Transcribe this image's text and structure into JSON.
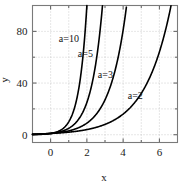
{
  "chart_data": {
    "type": "line",
    "title": "",
    "subtitle": "",
    "xlabel": "x",
    "ylabel": "y",
    "xlim": [
      -1,
      7
    ],
    "ylim": [
      -6,
      100
    ],
    "grid": true,
    "legend_position": "inline-annotations",
    "function": "y = a^x",
    "x_ticks": [
      0,
      2,
      4,
      6
    ],
    "x_tick_labels": [
      "0",
      "2",
      "4",
      "6"
    ],
    "x_minor_ticks": [
      -1,
      1,
      3,
      5,
      7
    ],
    "y_ticks": [
      0,
      40,
      80
    ],
    "y_tick_labels": [
      "0",
      "40",
      "80"
    ],
    "y_minor_ticks": [
      20,
      60,
      100
    ],
    "series": [
      {
        "name": "a=10",
        "base": 10,
        "label": "a=10",
        "label_x": 0.45,
        "label_y": 72,
        "color": "#000000",
        "x": [
          -1,
          -0.5,
          0,
          0.25,
          0.5,
          0.75,
          1,
          1.125,
          1.25,
          1.375,
          1.5,
          1.625,
          1.75,
          1.875,
          2
        ],
        "y": [
          0.1,
          0.32,
          1,
          1.78,
          3.16,
          5.62,
          10,
          13.34,
          17.78,
          23.71,
          31.62,
          42.17,
          56.23,
          74.99,
          100
        ]
      },
      {
        "name": "a=5",
        "base": 5,
        "label": "a=5",
        "label_x": 1.5,
        "label_y": 60,
        "color": "#000000",
        "x": [
          -1,
          -0.5,
          0,
          0.5,
          1,
          1.5,
          1.75,
          2,
          2.25,
          2.5,
          2.625,
          2.75,
          2.8614
        ],
        "y": [
          0.2,
          0.447,
          1,
          2.236,
          5,
          11.18,
          16.72,
          25,
          37.38,
          55.9,
          68.3,
          83.6,
          100
        ]
      },
      {
        "name": "a=3",
        "base": 3,
        "label": "a=3",
        "label_x": 2.6,
        "label_y": 44,
        "color": "#000000",
        "x": [
          -1,
          -0.5,
          0,
          0.5,
          1,
          1.5,
          2,
          2.5,
          3,
          3.25,
          3.5,
          3.75,
          4,
          4.1918
        ],
        "y": [
          0.333,
          0.577,
          1,
          1.732,
          3,
          5.196,
          9,
          15.59,
          27,
          35.53,
          46.77,
          61.55,
          81,
          100
        ]
      },
      {
        "name": "a=2",
        "base": 2,
        "label": "a=2",
        "label_x": 4.25,
        "label_y": 28,
        "color": "#000000",
        "x": [
          -1,
          -0.5,
          0,
          0.5,
          1,
          1.5,
          2,
          2.5,
          3,
          3.5,
          4,
          4.5,
          5,
          5.5,
          6,
          6.3,
          6.6439
        ],
        "y": [
          0.5,
          0.707,
          1,
          1.414,
          2,
          2.828,
          4,
          5.657,
          8,
          11.31,
          16,
          22.63,
          32,
          45.25,
          64,
          78.8,
          100
        ]
      }
    ]
  }
}
